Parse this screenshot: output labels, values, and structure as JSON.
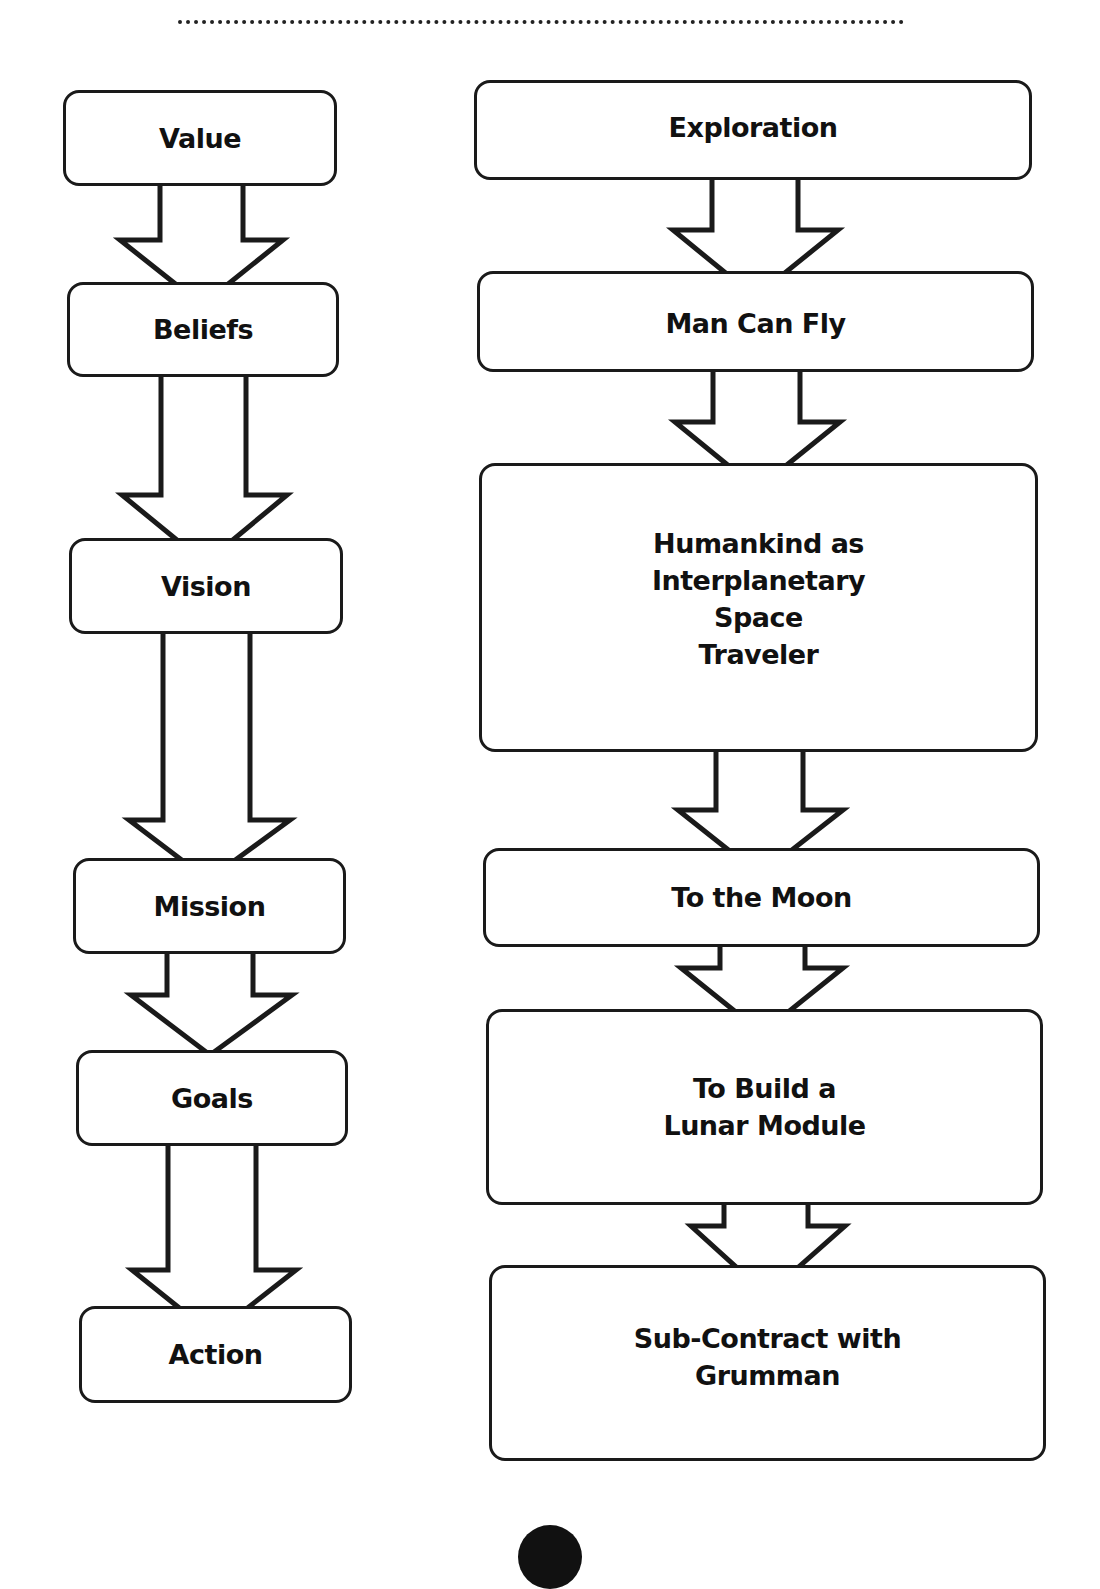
{
  "left_column": {
    "nodes": [
      {
        "label": "Value"
      },
      {
        "label": "Beliefs"
      },
      {
        "label": "Vision"
      },
      {
        "label": "Mission"
      },
      {
        "label": "Goals"
      },
      {
        "label": "Action"
      }
    ]
  },
  "right_column": {
    "nodes": [
      {
        "label": "Exploration"
      },
      {
        "label": "Man Can Fly"
      },
      {
        "label": "Humankind as\nInterplanetary\nSpace\nTraveler"
      },
      {
        "label": "To the Moon"
      },
      {
        "label": "To Build a\nLunar Module"
      },
      {
        "label": "Sub-Contract with\nGrumman"
      }
    ]
  },
  "colors": {
    "stroke": "#1a1a1a",
    "background": "#ffffff",
    "text": "#111111"
  }
}
